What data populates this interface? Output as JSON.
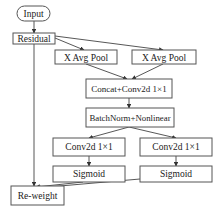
{
  "diagram": {
    "nodes": [
      {
        "id": "input",
        "label": "Input",
        "shape": "rounded"
      },
      {
        "id": "residual",
        "label": "Residual",
        "shape": "rect"
      },
      {
        "id": "x_avg_pool_left",
        "label": "X Avg Pool",
        "shape": "rect"
      },
      {
        "id": "x_avg_pool_right",
        "label": "X Avg Pool",
        "shape": "rect"
      },
      {
        "id": "concat_conv",
        "label": "Concat+Conv2d 1×1",
        "shape": "rect"
      },
      {
        "id": "batchnorm",
        "label": "BatchNorm+Nonlinear",
        "shape": "rect"
      },
      {
        "id": "conv_left",
        "label": "Conv2d 1×1",
        "shape": "rect"
      },
      {
        "id": "conv_right",
        "label": "Conv2d 1×1",
        "shape": "rect"
      },
      {
        "id": "sigmoid_left",
        "label": "Sigmoid",
        "shape": "rect"
      },
      {
        "id": "sigmoid_right",
        "label": "Sigmoid",
        "shape": "rect"
      },
      {
        "id": "reweight",
        "label": "Re-weight",
        "shape": "rect"
      }
    ],
    "edges": [
      {
        "from": "input",
        "to": "residual"
      },
      {
        "from": "residual",
        "to": "x_avg_pool_left"
      },
      {
        "from": "residual",
        "to": "x_avg_pool_right"
      },
      {
        "from": "residual",
        "to": "reweight"
      },
      {
        "from": "x_avg_pool_left",
        "to": "concat_conv"
      },
      {
        "from": "x_avg_pool_right",
        "to": "concat_conv"
      },
      {
        "from": "concat_conv",
        "to": "batchnorm"
      },
      {
        "from": "batchnorm",
        "to": "conv_left"
      },
      {
        "from": "batchnorm",
        "to": "conv_right"
      },
      {
        "from": "conv_left",
        "to": "sigmoid_left"
      },
      {
        "from": "conv_right",
        "to": "sigmoid_right"
      },
      {
        "from": "sigmoid_left",
        "to": "reweight"
      },
      {
        "from": "sigmoid_right",
        "to": "reweight"
      }
    ]
  },
  "labels": {
    "input": "Input",
    "residual": "Residual",
    "x_avg_pool_left": "X Avg Pool",
    "x_avg_pool_right": "X Avg Pool",
    "concat_conv": "Concat+Conv2d 1×1",
    "batchnorm": "BatchNorm+Nonlinear",
    "conv_left": "Conv2d 1×1",
    "conv_right": "Conv2d 1×1",
    "sigmoid_left": "Sigmoid",
    "sigmoid_right": "Sigmoid",
    "reweight": "Re-weight"
  },
  "colors": {
    "stroke": "#555555",
    "text": "#222222",
    "background": "#ffffff"
  }
}
